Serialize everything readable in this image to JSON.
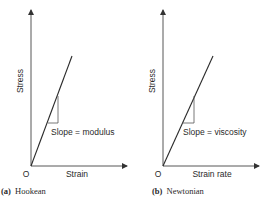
{
  "panels": [
    {
      "id": "a",
      "caption_letter": "(a)",
      "caption_text": "Hookean",
      "ylabel": "Stress",
      "xlabel": "Strain",
      "origin_label": "O",
      "slope_label": "Slope = modulus"
    },
    {
      "id": "b",
      "caption_letter": "(b)",
      "caption_text": "Newtonian",
      "ylabel": "Stress",
      "xlabel": "Strain rate",
      "origin_label": "O",
      "slope_label": "Slope = viscosity"
    }
  ],
  "colors": {
    "line": "#2a2a2a",
    "axis": "#555555"
  }
}
